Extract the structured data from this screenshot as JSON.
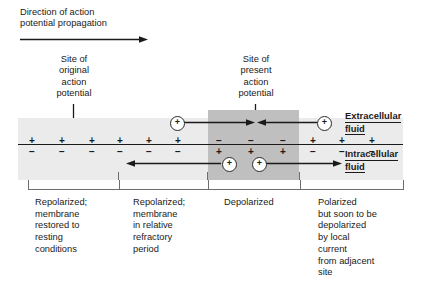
{
  "header": {
    "line1": "Direction of action",
    "line2": "potential propagation",
    "arrow_label": "rightward-arrow"
  },
  "callouts": [
    {
      "id": "original",
      "lines": [
        "Site of",
        "original",
        "action",
        "potential"
      ],
      "arrow": "down-arrow"
    },
    {
      "id": "present",
      "lines": [
        "Site of",
        "present",
        "action",
        "potential"
      ],
      "arrow": "down-arrow"
    }
  ],
  "membrane": {
    "extracellular_label_line1": "Extracellular",
    "extracellular_label_line2": "fluid",
    "intracellular_label_line1": "Intracellular",
    "intracellular_label_line2": "fluid",
    "outer_charges": [
      "+",
      "+",
      "+",
      "+",
      "+",
      "+",
      "−",
      "−",
      "−",
      "+",
      "+",
      "+"
    ],
    "inner_charges": [
      "−",
      "−",
      "−",
      "−",
      "−",
      "−",
      "+",
      "+",
      "+",
      "−",
      "−",
      "−"
    ],
    "charge_x": [
      32,
      62,
      92,
      120,
      149,
      178,
      219,
      251,
      283,
      313,
      342,
      372
    ],
    "depolarized_zone": {
      "x": 208,
      "width": 91
    },
    "band": {
      "x": 18,
      "width": 385
    },
    "colors": {
      "band": "#ebebeb",
      "depolarized": "#bfbfbf",
      "membrane_line": "#1a1a1a",
      "text": "#1a1a1a",
      "bracket": "#6d6d6d"
    }
  },
  "ions": [
    {
      "id": "ion-extracellular-left",
      "symbol": "+",
      "x": 170,
      "y": 116
    },
    {
      "id": "ion-extracellular-right",
      "symbol": "+",
      "x": 317,
      "y": 116
    },
    {
      "id": "ion-intracellular-left",
      "symbol": "+",
      "x": 222,
      "y": 157
    },
    {
      "id": "ion-intracellular-right",
      "symbol": "+",
      "x": 252,
      "y": 157
    }
  ],
  "current_arrows": [
    {
      "id": "extracellular-inflow-left",
      "direction": "right"
    },
    {
      "id": "extracellular-inflow-right",
      "direction": "left"
    },
    {
      "id": "intracellular-outflow-left",
      "direction": "left"
    },
    {
      "id": "intracellular-outflow-right",
      "direction": "right"
    }
  ],
  "regions": [
    {
      "id": "repolarized-resting",
      "bracket": {
        "x": 28,
        "width": 90
      },
      "caption": [
        "Repolarized;",
        "membrane",
        "restored to",
        "resting",
        "conditions"
      ]
    },
    {
      "id": "repolarized-refractory",
      "bracket": {
        "x": 119,
        "width": 88
      },
      "caption": [
        "Repolarized;",
        "membrane",
        "in relative",
        "refractory",
        "period"
      ]
    },
    {
      "id": "depolarized",
      "bracket": {
        "x": 208,
        "width": 91
      },
      "caption": [
        "Depolarized"
      ]
    },
    {
      "id": "polarized-soon-depolarized",
      "bracket": {
        "x": 300,
        "width": 102
      },
      "caption": [
        "Polarized",
        "but soon to be",
        "depolarized",
        "by local",
        "current",
        "from adjacent",
        "site"
      ]
    }
  ]
}
